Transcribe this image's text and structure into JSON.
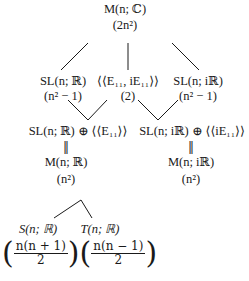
{
  "nodes": {
    "top": {
      "name": "M(n; ℂ)",
      "dim": "(2n²)"
    },
    "sl_r": {
      "name": "SL(n; ℝ)",
      "dim": "(n² − 1)"
    },
    "span": {
      "name": "⟨⟨E₁₁, iE₁₁⟩⟩",
      "dim": "(2)"
    },
    "sl_ir": {
      "name": "SL(n; iℝ)",
      "dim": "(n² − 1)"
    },
    "sum_r": {
      "name": "SL(n; ℝ) ⊕ ⟨⟨E₁₁⟩⟩",
      "eq": "‖",
      "equiv": "M(n; ℝ)",
      "dim": "(n²)"
    },
    "sum_ir": {
      "name": "SL(n; iℝ) ⊕ ⟨⟨iE₁₁⟩⟩",
      "eq": "‖",
      "equiv": "M(n; iℝ)",
      "dim": "(n²)"
    },
    "sym": {
      "name": "S(n; ℝ)",
      "num": "n(n + 1)",
      "den": "2"
    },
    "skew": {
      "name": "T(n; ℝ)",
      "num": "n(n − 1)",
      "den": "2"
    }
  },
  "paren": {
    "open": "(",
    "close": ")"
  }
}
